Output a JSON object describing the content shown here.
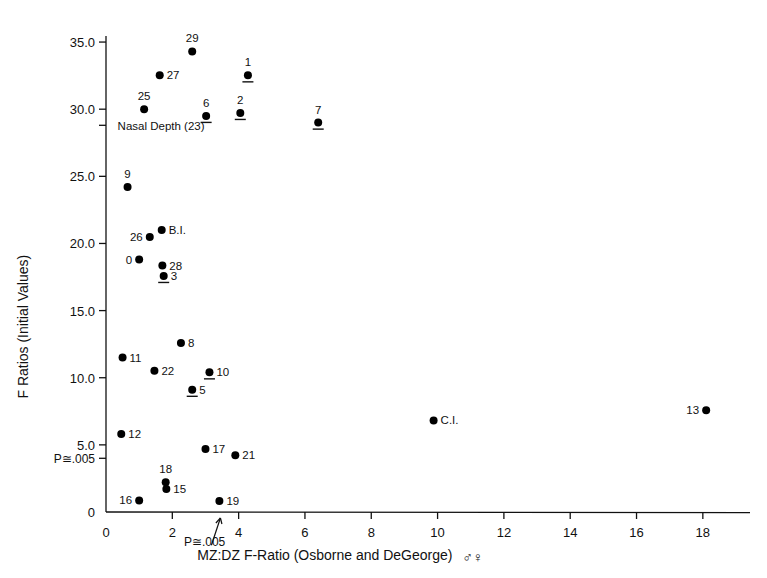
{
  "chart_data": {
    "type": "scatter",
    "title": "",
    "xlabel": "MZ:DZ  F-Ratio (Osborne and DeGeorge)",
    "xlabel_suffix": "♂♀",
    "ylabel": "F Ratios (Initial Values)",
    "xlim": [
      0,
      19.0
    ],
    "ylim": [
      0,
      35.6
    ],
    "grid": false,
    "legend": "none",
    "xticks": [
      0,
      2,
      4,
      6,
      8,
      10,
      12,
      14,
      16,
      18
    ],
    "xtick_labels": [
      "0",
      "2",
      "4",
      "6",
      "8",
      "10",
      "12",
      "14",
      "16",
      "18"
    ],
    "yticks": [
      0,
      5.0,
      10.0,
      15.0,
      20.0,
      25.0,
      30.0,
      35.0
    ],
    "ytick_labels": [
      "0",
      "5.0",
      "10.0",
      "15.0",
      "20.0",
      "25.0",
      "30.0",
      "35.0"
    ],
    "extra_yticks": [
      {
        "value": 4.0,
        "label": "P≅.005"
      },
      {
        "value": 28.8,
        "label": ""
      }
    ],
    "annotations": [
      {
        "text": "Nasal Depth (23)",
        "x": 0.35,
        "y": 28.8,
        "kind": "axis-note"
      },
      {
        "text": "P≅.005",
        "x": 2.35,
        "y": -2.55,
        "kind": "x-arrow-note",
        "arrow_to_x": 3.45
      }
    ],
    "points": [
      {
        "label": "29",
        "x": 2.6,
        "y": 34.3,
        "label_pos": "above",
        "underline": false
      },
      {
        "label": "27",
        "x": 1.62,
        "y": 32.52,
        "label_pos": "right",
        "underline": false
      },
      {
        "label": "1",
        "x": 4.28,
        "y": 32.52,
        "label_pos": "above",
        "underline": true
      },
      {
        "label": "25",
        "x": 1.15,
        "y": 30.0,
        "label_pos": "above",
        "underline": false
      },
      {
        "label": "6",
        "x": 3.02,
        "y": 29.5,
        "label_pos": "above",
        "underline": true
      },
      {
        "label": "2",
        "x": 4.05,
        "y": 29.72,
        "label_pos": "above",
        "underline": true
      },
      {
        "label": "7",
        "x": 6.4,
        "y": 29.0,
        "label_pos": "above",
        "underline": true
      },
      {
        "label": "9",
        "x": 0.65,
        "y": 24.2,
        "label_pos": "above",
        "underline": false
      },
      {
        "label": "B.I.",
        "x": 1.68,
        "y": 21.0,
        "label_pos": "right",
        "underline": false
      },
      {
        "label": "26",
        "x": 1.32,
        "y": 20.48,
        "label_pos": "left",
        "underline": false
      },
      {
        "label": "0",
        "x": 1.0,
        "y": 18.8,
        "label_pos": "left",
        "underline": false
      },
      {
        "label": "28",
        "x": 1.7,
        "y": 18.35,
        "label_pos": "right",
        "underline": false
      },
      {
        "label": "3",
        "x": 1.74,
        "y": 17.58,
        "label_pos": "right",
        "underline": true
      },
      {
        "label": "8",
        "x": 2.26,
        "y": 12.58,
        "label_pos": "right",
        "underline": false
      },
      {
        "label": "11",
        "x": 0.5,
        "y": 11.5,
        "label_pos": "right",
        "underline": false
      },
      {
        "label": "22",
        "x": 1.46,
        "y": 10.52,
        "label_pos": "right",
        "underline": false
      },
      {
        "label": "10",
        "x": 3.12,
        "y": 10.4,
        "label_pos": "right",
        "underline": true
      },
      {
        "label": "5",
        "x": 2.6,
        "y": 9.1,
        "label_pos": "right",
        "underline": true
      },
      {
        "label": "C.I.",
        "x": 9.88,
        "y": 6.82,
        "label_pos": "right",
        "underline": false
      },
      {
        "label": "13",
        "x": 18.1,
        "y": 7.58,
        "label_pos": "left",
        "underline": false
      },
      {
        "label": "12",
        "x": 0.46,
        "y": 5.8,
        "label_pos": "right",
        "underline": false
      },
      {
        "label": "17",
        "x": 3.0,
        "y": 4.7,
        "label_pos": "right",
        "underline": false
      },
      {
        "label": "21",
        "x": 3.9,
        "y": 4.22,
        "label_pos": "right",
        "underline": false
      },
      {
        "label": "18",
        "x": 1.8,
        "y": 2.22,
        "label_pos": "above",
        "underline": false
      },
      {
        "label": "15",
        "x": 1.82,
        "y": 1.72,
        "label_pos": "right",
        "underline": false
      },
      {
        "label": "16",
        "x": 1.0,
        "y": 0.86,
        "label_pos": "left",
        "underline": false
      },
      {
        "label": "19",
        "x": 3.42,
        "y": 0.82,
        "label_pos": "right",
        "underline": false
      }
    ]
  },
  "colors": {
    "ink": "#111111",
    "background": "#ffffff",
    "marker": "#000000"
  }
}
